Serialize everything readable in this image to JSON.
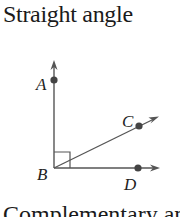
{
  "title": "Straight angle",
  "caption": "Complementary angle",
  "diagram": {
    "points": {
      "A": "A",
      "B": "B",
      "C": "C",
      "D": "D"
    },
    "right_angle_marker": true,
    "line_color": "#555555",
    "point_color": "#444444"
  }
}
